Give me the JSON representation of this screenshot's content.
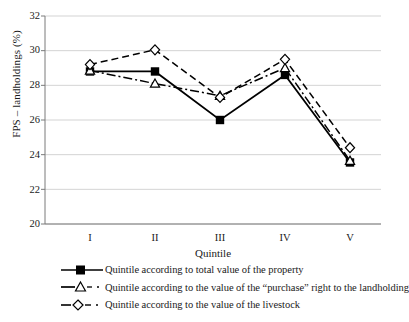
{
  "chart_data": {
    "type": "line",
    "title": "",
    "xlabel": "Quintile",
    "ylabel": "FPS – landholdings (%)",
    "categories": [
      "I",
      "II",
      "III",
      "IV",
      "V"
    ],
    "ylim": [
      20,
      32
    ],
    "yticks": [
      20,
      22,
      24,
      26,
      28,
      30,
      32
    ],
    "ytick_labels": [
      "20",
      "22",
      "24",
      "26",
      "28",
      "30",
      "32"
    ],
    "grid": "horizontal",
    "legend_position": "bottom-left",
    "series": [
      {
        "name": "Quintile according to total value of the property",
        "marker": "filled-square",
        "line_style": "solid",
        "color": "#000000",
        "values": [
          28.8,
          28.8,
          26.0,
          28.6,
          23.55
        ]
      },
      {
        "name": "Quintile according to the value of the “purchase” right to the landholding",
        "marker": "open-triangle",
        "line_style": "dash-dot",
        "color": "#000000",
        "values": [
          28.85,
          28.1,
          27.4,
          29.0,
          23.65
        ]
      },
      {
        "name": "Quintile according to the value of the livestock",
        "marker": "open-diamond",
        "line_style": "dashed",
        "color": "#000000",
        "values": [
          29.2,
          30.05,
          27.3,
          29.5,
          24.4
        ]
      }
    ]
  },
  "axis": {
    "y_title": "FPS – landholdings (%)",
    "x_title": "Quintile",
    "y_labels": [
      "32",
      "30",
      "28",
      "26",
      "24",
      "22",
      "20"
    ],
    "x_labels": [
      "I",
      "II",
      "III",
      "IV",
      "V"
    ]
  },
  "legend": {
    "items": [
      {
        "label": "Quintile according to total value of the property"
      },
      {
        "label": "Quintile according to the value of the “purchase” right to the landholding"
      },
      {
        "label": "Quintile according to the value of the livestock"
      }
    ]
  }
}
